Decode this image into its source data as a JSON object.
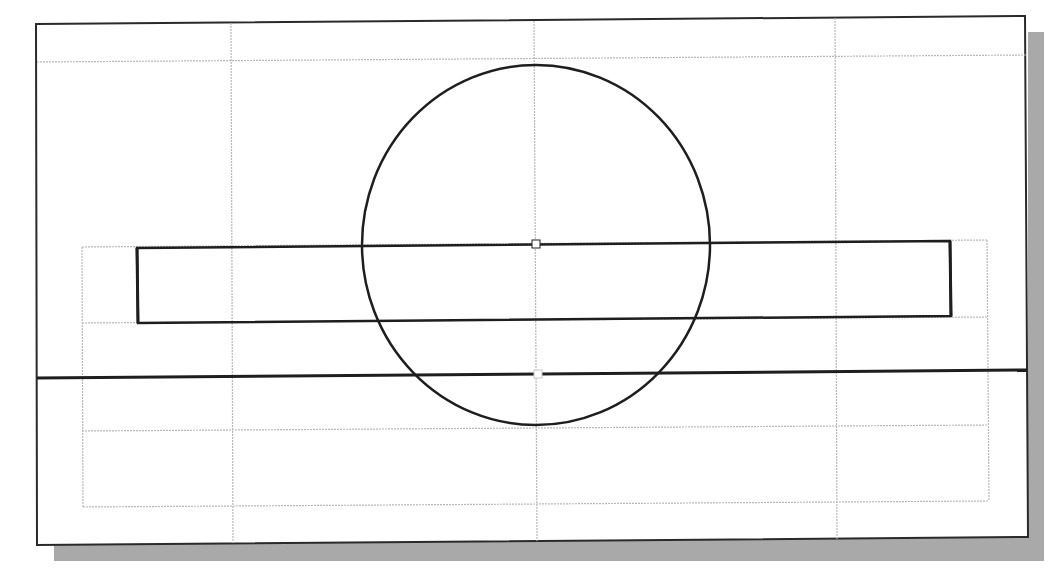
{
  "canvas": {
    "width": 1058,
    "height": 577,
    "background": "#ffffff"
  },
  "colors": {
    "frame": "#2a2a2a",
    "shadow": "#a9a9a9",
    "construction": "#b8b8b8",
    "geometry": "#1e1e1e",
    "marker": "#c9c9c9"
  },
  "viewport": {
    "frame": {
      "points": "36,24 1025,16 1028,537 37,545"
    },
    "shadow": {
      "points": "1028,32 1044,32 1044,561 54,561 54,545 1028,537"
    }
  },
  "construction_lines": [
    {
      "name": "grid-horizontal-top",
      "x1": 37,
      "y1": 62,
      "x2": 1026,
      "y2": 55
    },
    {
      "name": "grid-vertical-left",
      "x1": 231,
      "y1": 23,
      "x2": 233,
      "y2": 543
    },
    {
      "name": "grid-vertical-center",
      "x1": 534,
      "y1": 21,
      "x2": 537,
      "y2": 541
    },
    {
      "name": "grid-vertical-right",
      "x1": 835,
      "y1": 18,
      "x2": 837,
      "y2": 539
    },
    {
      "name": "grid-horizontal-mid",
      "x1": 82,
      "y1": 323,
      "x2": 988,
      "y2": 317
    },
    {
      "name": "grid-horizontal-lower",
      "x1": 82,
      "y1": 431,
      "x2": 988,
      "y2": 425
    },
    {
      "name": "grid-horizontal-bottom",
      "x1": 83,
      "y1": 507,
      "x2": 989,
      "y2": 501
    },
    {
      "name": "grid-rect-top",
      "x1": 82,
      "y1": 247,
      "x2": 987,
      "y2": 240
    },
    {
      "name": "grid-rect-left",
      "x1": 82,
      "y1": 247,
      "x2": 83,
      "y2": 507
    },
    {
      "name": "grid-rect-right",
      "x1": 987,
      "y1": 240,
      "x2": 989,
      "y2": 501
    }
  ],
  "geometry": {
    "circle": {
      "cx": 536,
      "cy": 245,
      "rx": 174,
      "ry": 180,
      "stroke_width": 2.5
    },
    "rectangle": {
      "points": "137,248 950,241 951,316 138,323",
      "stroke_width": 2.5
    },
    "rectangle_edge_thick": [
      {
        "x1": 137,
        "y1": 248,
        "x2": 138,
        "y2": 323
      },
      {
        "x1": 950,
        "y1": 241,
        "x2": 951,
        "y2": 316
      }
    ],
    "base_line": {
      "x1": 37,
      "y1": 378,
      "x2": 1027,
      "y2": 370,
      "stroke_width": 3
    }
  },
  "markers": [
    {
      "name": "circle-center-marker",
      "x": 532,
      "y": 240,
      "w": 8,
      "h": 8
    },
    {
      "name": "baseline-midpoint-marker",
      "x": 534,
      "y": 370,
      "w": 8,
      "h": 8
    }
  ]
}
